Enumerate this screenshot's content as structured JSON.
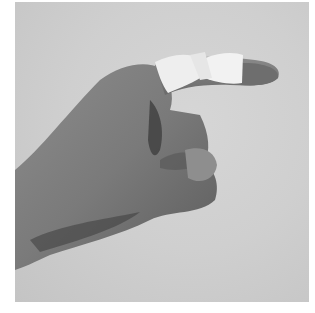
{
  "image": {
    "description": "Grayscale photograph of a right hand with the index finger extended and bound with white tape at two points (buddy/splint taping), other fingers curled, against a light gray background",
    "colors": {
      "background": "#cfcfcf",
      "skin_light": "#9a9a9a",
      "skin_mid": "#7e7e7e",
      "skin_dark": "#4a4a4a",
      "tape": "#efefef",
      "border": "#ffffff"
    }
  }
}
